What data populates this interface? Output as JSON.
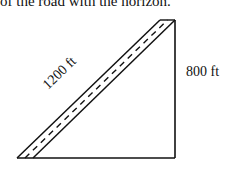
{
  "caption": "of the road with the horizon.",
  "diagram": {
    "type": "right-triangle",
    "hypotenuse_label": "1200 ft",
    "vertical_label": "800 ft",
    "hypotenuse_style": "road with dashed center line",
    "stroke_color": "#111111"
  }
}
